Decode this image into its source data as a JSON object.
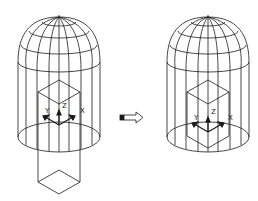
{
  "figure": {
    "type": "cad-wireframe-transformation",
    "before": {
      "description": "dome-topped cylinder with box protruding below",
      "axis_labels": [
        "Z",
        "Y",
        "X"
      ]
    },
    "arrow": {
      "icon": "right-arrow-icon"
    },
    "after": {
      "description": "dome-topped cylinder with box moved inside",
      "axis_labels": [
        "Z",
        "Y",
        "X"
      ]
    }
  },
  "colors": {
    "line": "#1a1a1a",
    "background": "#ffffff"
  }
}
